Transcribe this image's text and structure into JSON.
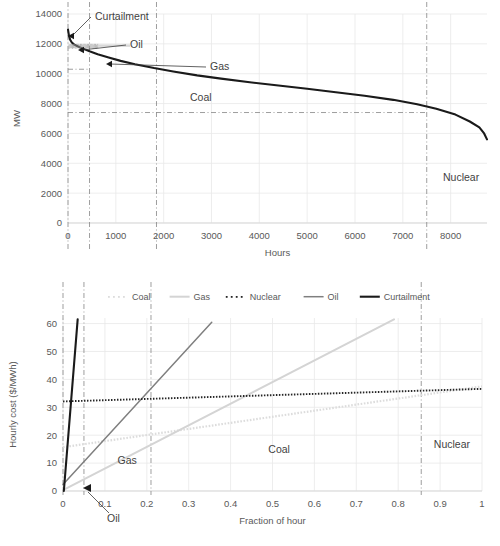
{
  "figure": {
    "title": "",
    "background": "#ffffff",
    "width": 500,
    "height": 546
  },
  "colors": {
    "curtailment": "#1a1a1a",
    "oil": "#7f7f7f",
    "gas": "#d4d4d4",
    "coal": "#dcdcdc",
    "nuclear": "#262626",
    "grid": "#e8e8e8",
    "axis": "#d9d9d9",
    "text": "#595959",
    "guide": "#8c8c8c"
  },
  "chart_data": [
    {
      "id": "load-duration-curve",
      "type": "line",
      "title": "",
      "xlabel": "Hours",
      "ylabel": "MW",
      "xlim": [
        0,
        8760
      ],
      "ylim": [
        0,
        14000
      ],
      "xticks": [
        0,
        1000,
        2000,
        3000,
        4000,
        5000,
        6000,
        7000,
        8000
      ],
      "yticks": [
        0,
        2000,
        4000,
        6000,
        8000,
        10000,
        12000,
        14000
      ],
      "grid": true,
      "legend": "none",
      "series": [
        {
          "name": "Curtailment",
          "style": "solid-thick-black",
          "x": [
            0,
            20,
            45,
            80,
            130,
            200,
            300,
            450,
            620,
            850,
            1100,
            1400,
            1800,
            2200,
            2700,
            3200,
            3800,
            4400,
            5000,
            5600,
            6200,
            6800,
            7300,
            7700,
            8100,
            8400,
            8600,
            8700,
            8760
          ],
          "y": [
            12950,
            12550,
            12280,
            12090,
            11950,
            11840,
            11700,
            11500,
            11300,
            11080,
            10860,
            10640,
            10380,
            10150,
            9890,
            9670,
            9430,
            9210,
            8990,
            8760,
            8520,
            8250,
            7950,
            7650,
            7260,
            6800,
            6400,
            6000,
            5600
          ]
        }
      ],
      "guides": {
        "vertical": [
          {
            "x": 0,
            "label": ""
          },
          {
            "x": 450,
            "label": ""
          },
          {
            "x": 1850,
            "label": ""
          },
          {
            "x": 7500,
            "label": ""
          }
        ],
        "horizontal": [
          {
            "y": 10300,
            "xmax": 450
          },
          {
            "y": 7400,
            "xmax": 7500
          }
        ]
      },
      "annotations": [
        {
          "text": "Curtailment",
          "x": 95,
          "y": 20,
          "anchor": "start",
          "arrow_to": {
            "px": 68,
            "py": 36
          }
        },
        {
          "text": "Oil",
          "x": 130,
          "y": 48,
          "anchor": "start",
          "arrow_to": {
            "px": 78,
            "py": 50
          }
        },
        {
          "text": "Gas",
          "x": 210,
          "y": 70,
          "anchor": "start",
          "arrow_to": {
            "px": 106,
            "py": 64
          }
        },
        {
          "text": "Coal",
          "x": 190,
          "y": 101,
          "anchor": "start"
        },
        {
          "text": "Nuclear",
          "x": 443,
          "y": 181,
          "anchor": "start"
        }
      ]
    },
    {
      "id": "hourly-cost-merit-order",
      "type": "line",
      "title": "",
      "xlabel": "Fraction of hour",
      "ylabel": "Hourly cost ($/MWh)",
      "xlim": [
        0,
        1
      ],
      "ylim": [
        0,
        62
      ],
      "xticks": [
        0,
        0.1,
        0.2,
        0.3,
        0.4,
        0.5,
        0.6,
        0.7,
        0.8,
        0.9,
        1
      ],
      "yticks": [
        0,
        10,
        20,
        30,
        40,
        50,
        60
      ],
      "grid": true,
      "legend": "top",
      "legend_items": [
        {
          "label": "Coal",
          "style": "dotted-light"
        },
        {
          "label": "Gas",
          "style": "solid-light"
        },
        {
          "label": "Nuclear",
          "style": "dotted-dark"
        },
        {
          "label": "Oil",
          "style": "solid-gray"
        },
        {
          "label": "Curtailment",
          "style": "solid-thick-black"
        }
      ],
      "series": [
        {
          "name": "Curtailment",
          "style": "solid-thick-black",
          "x": [
            0.002,
            0.035
          ],
          "y": [
            0,
            61.5
          ]
        },
        {
          "name": "Oil",
          "style": "solid-gray",
          "x": [
            0.0,
            0.355
          ],
          "y": [
            2.3,
            60.5
          ]
        },
        {
          "name": "Gas",
          "style": "solid-light",
          "x": [
            0.0,
            0.79
          ],
          "y": [
            0.3,
            61.5
          ]
        },
        {
          "name": "Coal",
          "style": "dotted-light",
          "x": [
            0.0,
            1.0
          ],
          "y": [
            15.7,
            37.5
          ]
        },
        {
          "name": "Nuclear",
          "style": "dotted-dark",
          "x": [
            0.0,
            1.0
          ],
          "y": [
            32.1,
            36.6
          ]
        }
      ],
      "guides": {
        "vertical": [
          {
            "x": 0.0
          },
          {
            "x": 0.05
          },
          {
            "x": 0.21
          },
          {
            "x": 0.855
          }
        ]
      },
      "annotations": [
        {
          "text": "Gas",
          "x": 0.13,
          "y": 9.5,
          "anchor": "start"
        },
        {
          "text": "Coal",
          "x": 0.49,
          "y": 13.5,
          "anchor": "start"
        },
        {
          "text": "Nuclear",
          "x": 0.885,
          "y": 15.5,
          "anchor": "start"
        },
        {
          "text": "Oil",
          "x": 0.105,
          "y": -7.0,
          "anchor": "start",
          "arrow_to": {
            "px": 86,
            "py": 489
          }
        }
      ]
    }
  ]
}
